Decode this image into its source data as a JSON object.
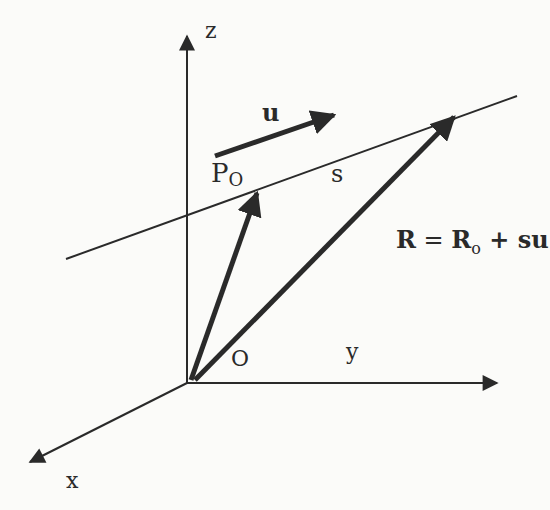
{
  "diagram": {
    "colors": {
      "ink": "#2a2a2a",
      "background": "#fbfbf9"
    },
    "axes": {
      "z_label": "z",
      "x_label": "x",
      "y_label": "y",
      "origin_label": "O"
    },
    "labels": {
      "direction_vector": "u",
      "parameter": "s",
      "point_main": "P",
      "point_sub": "O"
    },
    "equation": {
      "lhs": "R",
      "equals": " = ",
      "r_main": "R",
      "r_sub": "o",
      "plus": " + su"
    }
  }
}
